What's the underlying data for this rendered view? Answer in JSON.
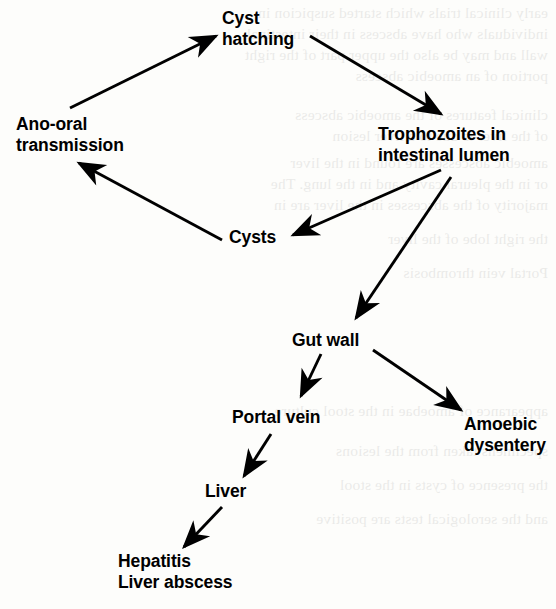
{
  "diagram": {
    "type": "flow-diagram",
    "background_color": "#fdfdfb",
    "ink_color": "#000000",
    "nodes": [
      {
        "id": "cyst-hatching",
        "lines": [
          "Cyst",
          "hatching"
        ],
        "x": 222,
        "y": 8,
        "align": "left"
      },
      {
        "id": "trophozoites",
        "lines": [
          "Trophozoites in",
          "intestinal lumen"
        ],
        "x": 378,
        "y": 124,
        "align": "left"
      },
      {
        "id": "ano-oral",
        "lines": [
          "Ano-oral",
          "transmission"
        ],
        "x": 16,
        "y": 114,
        "align": "left"
      },
      {
        "id": "cysts",
        "lines": [
          "Cysts"
        ],
        "x": 229,
        "y": 227,
        "align": "left"
      },
      {
        "id": "gut-wall",
        "lines": [
          "Gut wall"
        ],
        "x": 292,
        "y": 330,
        "align": "left"
      },
      {
        "id": "portal-vein",
        "lines": [
          "Portal vein"
        ],
        "x": 232,
        "y": 407,
        "align": "left"
      },
      {
        "id": "amoebic-dysentery",
        "lines": [
          "Amoebic",
          "dysentery"
        ],
        "x": 464,
        "y": 414,
        "align": "left"
      },
      {
        "id": "liver",
        "lines": [
          "Liver"
        ],
        "x": 205,
        "y": 481,
        "align": "left"
      },
      {
        "id": "hepatitis",
        "lines": [
          "Hepatitis",
          "Liver abscess"
        ],
        "x": 118,
        "y": 551,
        "align": "left"
      }
    ],
    "edges": [
      {
        "id": "ano-oral-to-cyst-hatching",
        "from": "ano-oral",
        "to": "cyst-hatching",
        "x1": 70,
        "y1": 108,
        "x2": 216,
        "y2": 36
      },
      {
        "id": "cyst-hatching-to-trophozoites",
        "from": "cyst-hatching",
        "to": "trophozoites",
        "x1": 310,
        "y1": 36,
        "x2": 441,
        "y2": 114
      },
      {
        "id": "trophozoites-to-cysts",
        "from": "trophozoites",
        "to": "cysts",
        "x1": 441,
        "y1": 170,
        "x2": 293,
        "y2": 235
      },
      {
        "id": "cysts-to-ano-oral",
        "from": "cysts",
        "to": "ano-oral",
        "x1": 222,
        "y1": 240,
        "x2": 79,
        "y2": 163
      },
      {
        "id": "trophozoites-to-gut-wall",
        "from": "trophozoites",
        "to": "gut-wall",
        "x1": 451,
        "y1": 177,
        "x2": 356,
        "y2": 318
      },
      {
        "id": "gut-wall-to-portal-vein",
        "from": "gut-wall",
        "to": "portal-vein",
        "x1": 321,
        "y1": 354,
        "x2": 301,
        "y2": 396
      },
      {
        "id": "gut-wall-to-amoebic-dysentery",
        "from": "gut-wall",
        "to": "amoebic-dysentery",
        "x1": 373,
        "y1": 350,
        "x2": 461,
        "y2": 410
      },
      {
        "id": "portal-vein-to-liver",
        "from": "portal-vein",
        "to": "liver",
        "x1": 271,
        "y1": 434,
        "x2": 244,
        "y2": 476
      },
      {
        "id": "liver-to-hepatitis",
        "from": "liver",
        "to": "hepatitis",
        "x1": 222,
        "y1": 507,
        "x2": 184,
        "y2": 547
      }
    ]
  },
  "page_bleed": {
    "note": "faint mirrored show-through text from the reverse of the printed page",
    "lines": [
      {
        "x": 8,
        "y": 2,
        "text": "early clinical trials which started suspicion in"
      },
      {
        "x": 8,
        "y": 23,
        "text": "individuals who have abscess in their intestinal"
      },
      {
        "x": 8,
        "y": 44,
        "text": "wall and may be also the upper part of the right"
      },
      {
        "x": 8,
        "y": 65,
        "text": "portion of an amoebic abscess"
      },
      {
        "x": 8,
        "y": 104,
        "text": "clinical features of the amoebic abscess"
      },
      {
        "x": 8,
        "y": 125,
        "text": "of the liver is due to a liver lesion"
      },
      {
        "x": 8,
        "y": 152,
        "text": "amoebic abscesses are found in the liver"
      },
      {
        "x": 8,
        "y": 173,
        "text": "or in the pleural cavity and in the lung. The"
      },
      {
        "x": 8,
        "y": 194,
        "text": "majority of the abscesses in the liver are in"
      },
      {
        "x": 8,
        "y": 228,
        "text": "the right lobe of the liver"
      },
      {
        "x": 8,
        "y": 262,
        "text": "Portal vein thrombosis"
      },
      {
        "x": 8,
        "y": 400,
        "text": "appearance of amoebae in the stool culture"
      },
      {
        "x": 8,
        "y": 440,
        "text": "specimens taken from the lesions"
      },
      {
        "x": 8,
        "y": 474,
        "text": "the presence of cysts in the stool"
      },
      {
        "x": 8,
        "y": 508,
        "text": "and the serological tests are positive"
      }
    ]
  }
}
